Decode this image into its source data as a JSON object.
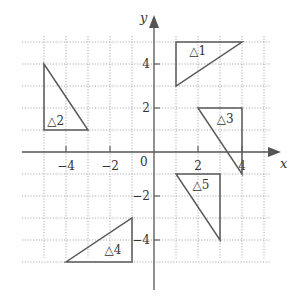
{
  "diagram": {
    "type": "coordinate-plane",
    "x_axis_label": "x",
    "y_axis_label": "y",
    "origin_label": "0",
    "x_range": [
      -5,
      5
    ],
    "y_range": [
      -5,
      5
    ],
    "grid_step": 1,
    "x_tick_labels": [
      {
        "value": -4,
        "text": "−4"
      },
      {
        "value": -2,
        "text": "−2"
      },
      {
        "value": 2,
        "text": "2"
      },
      {
        "value": 4,
        "text": "4"
      }
    ],
    "y_tick_labels": [
      {
        "value": 4,
        "text": "4"
      },
      {
        "value": 2,
        "text": "2"
      },
      {
        "value": -2,
        "text": "−2"
      },
      {
        "value": -4,
        "text": "−4"
      }
    ],
    "triangles": [
      {
        "label": "△1",
        "vertices": [
          [
            1,
            5
          ],
          [
            4,
            5
          ],
          [
            1,
            3
          ]
        ],
        "label_pos": [
          1.6,
          4.4
        ]
      },
      {
        "label": "△2",
        "vertices": [
          [
            -5,
            4
          ],
          [
            -5,
            1
          ],
          [
            -3,
            1
          ]
        ],
        "label_pos": [
          -4.85,
          1.25
        ]
      },
      {
        "label": "△3",
        "vertices": [
          [
            2,
            2
          ],
          [
            4,
            2
          ],
          [
            4,
            -1
          ]
        ],
        "label_pos": [
          2.85,
          1.3
        ]
      },
      {
        "label": "△4",
        "vertices": [
          [
            -1,
            -3
          ],
          [
            -1,
            -5
          ],
          [
            -4,
            -5
          ]
        ],
        "label_pos": [
          -2.25,
          -4.65
        ]
      },
      {
        "label": "△5",
        "vertices": [
          [
            1,
            -1
          ],
          [
            3,
            -1
          ],
          [
            3,
            -4
          ]
        ],
        "label_pos": [
          1.75,
          -1.7
        ]
      }
    ],
    "colors": {
      "grid": "#9a9a9a",
      "axes": "#555555",
      "triangles": "#5a5a5a",
      "text": "#333333"
    }
  }
}
